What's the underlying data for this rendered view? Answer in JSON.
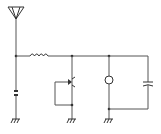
{
  "diagram": {
    "type": "schematic",
    "colors": {
      "background": "#ffffff",
      "wire": "#555555",
      "component": "#333333"
    },
    "components": [
      {
        "id": "antenna",
        "kind": "antenna-icon"
      },
      {
        "id": "inductor",
        "kind": "inductor-icon"
      },
      {
        "id": "crystal",
        "kind": "crystal-icon"
      },
      {
        "id": "variable-element",
        "kind": "transistor-icon"
      },
      {
        "id": "meter",
        "kind": "meter-icon"
      },
      {
        "id": "capacitor",
        "kind": "capacitor-icon"
      },
      {
        "id": "ground-1",
        "kind": "ground-icon"
      },
      {
        "id": "ground-2",
        "kind": "ground-icon"
      },
      {
        "id": "ground-3",
        "kind": "ground-icon"
      }
    ]
  }
}
